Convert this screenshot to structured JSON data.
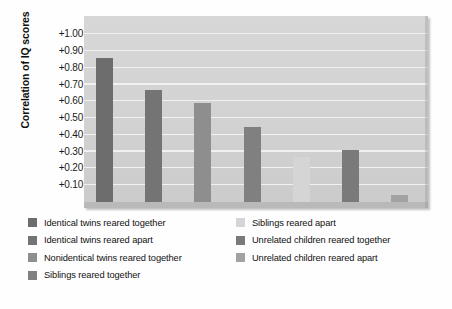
{
  "chart_data": {
    "type": "bar",
    "title": "",
    "subtitle": "",
    "xlabel": "",
    "ylabel": "Correlation of IQ scores",
    "ylim": [
      0.0,
      1.05
    ],
    "ytick_values": [
      1.0,
      0.9,
      0.8,
      0.7,
      0.6,
      0.5,
      0.4,
      0.3,
      0.2,
      0.1
    ],
    "ytick_labels": [
      "+1.00",
      "+0.90",
      "+0.80",
      "+0.70",
      "+0.60",
      "+0.50",
      "+0.40",
      "+0.30",
      "+0.20",
      "+0.10"
    ],
    "grid": true,
    "grid_axis": "y",
    "legend_position": "below",
    "legend_columns": 2,
    "categories": [
      "Identical twins reared together",
      "Identical twins reared apart",
      "Nonidentical twins reared together",
      "Siblings reared together",
      "Siblings reared apart",
      "Unrelated children reared together",
      "Unrelated children reared apart"
    ],
    "values": [
      0.86,
      0.67,
      0.59,
      0.45,
      0.27,
      0.31,
      0.04
    ],
    "colors": [
      "#6d6d6d",
      "#747474",
      "#8e8e8e",
      "#808080",
      "#d5d5d5",
      "#7a7a7a",
      "#a2a2a2"
    ],
    "series": [
      {
        "name": "Correlation of IQ scores",
        "values": [
          0.86,
          0.67,
          0.59,
          0.45,
          0.27,
          0.31,
          0.04
        ]
      }
    ]
  },
  "axis": {
    "y_title": "Correlation of IQ scores",
    "y_ticks": [
      {
        "label": "+1.00",
        "value": 1.0
      },
      {
        "label": "+0.90",
        "value": 0.9
      },
      {
        "label": "+0.80",
        "value": 0.8
      },
      {
        "label": "+0.70",
        "value": 0.7
      },
      {
        "label": "+0.60",
        "value": 0.6
      },
      {
        "label": "+0.50",
        "value": 0.5
      },
      {
        "label": "+0.40",
        "value": 0.4
      },
      {
        "label": "+0.30",
        "value": 0.3
      },
      {
        "label": "+0.20",
        "value": 0.2
      },
      {
        "label": "+0.10",
        "value": 0.1
      }
    ]
  },
  "legend": {
    "left_column": [
      {
        "label": "Identical twins reared together",
        "color": "#6d6d6d"
      },
      {
        "label": "Identical twins reared apart",
        "color": "#747474"
      },
      {
        "label": "Nonidentical twins reared together",
        "color": "#8e8e8e"
      },
      {
        "label": "Siblings reared together",
        "color": "#808080"
      }
    ],
    "right_column": [
      {
        "label": "Siblings reared apart",
        "color": "#d5d5d5"
      },
      {
        "label": "Unrelated children reared together",
        "color": "#7a7a7a"
      },
      {
        "label": "Unrelated children reared apart",
        "color": "#a2a2a2"
      }
    ]
  },
  "palette": {
    "panel_background": "#d4d4d4",
    "gridline": "#f1f1f1",
    "baseline": "#b9b9b9",
    "page_background": "#ffffff",
    "text": "#111111"
  }
}
